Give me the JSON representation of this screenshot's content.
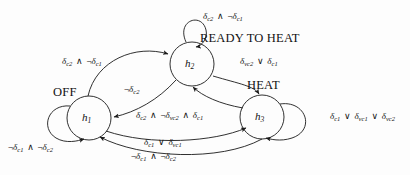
{
  "diagram": {
    "type": "state-machine",
    "title": "",
    "states": [
      {
        "id": "h1",
        "name": "h",
        "subscript": "1",
        "mode_label": "OFF",
        "cx": 89,
        "cy": 118,
        "r": 22
      },
      {
        "id": "h2",
        "name": "h",
        "subscript": "2",
        "mode_label": "READY TO HEAT",
        "cx": 192,
        "cy": 64,
        "r": 22
      },
      {
        "id": "h3",
        "name": "h",
        "subscript": "3",
        "mode_label": "HEAT",
        "cx": 262,
        "cy": 117,
        "r": 22
      }
    ],
    "self_loops": [
      {
        "id": "loop-h1",
        "state": "h1",
        "guard": "¬δc1 ∧ ¬δc2",
        "terms": [
          {
            "neg": true,
            "sym": "δ",
            "sub": "c1"
          },
          {
            "op": "∧"
          },
          {
            "neg": true,
            "sym": "δ",
            "sub": "c2"
          }
        ]
      },
      {
        "id": "loop-h2",
        "state": "h2",
        "guard": "δc2 ∧ ¬δc1",
        "terms": [
          {
            "neg": false,
            "sym": "δ",
            "sub": "c2"
          },
          {
            "op": "∧"
          },
          {
            "neg": true,
            "sym": "δ",
            "sub": "c1"
          }
        ]
      },
      {
        "id": "loop-h3",
        "state": "h3",
        "guard": "δc1 ∨ δvc1 ∨ δvc2",
        "terms": [
          {
            "neg": false,
            "sym": "δ",
            "sub": "c1"
          },
          {
            "op": "∨"
          },
          {
            "neg": false,
            "sym": "δ",
            "sub": "vc1"
          },
          {
            "op": "∨"
          },
          {
            "neg": false,
            "sym": "δ",
            "sub": "vc2"
          }
        ]
      }
    ],
    "transitions": [
      {
        "id": "h1-to-h2",
        "from": "h1",
        "to": "h2",
        "guard": "δc2 ∧ ¬δc1",
        "terms": [
          {
            "neg": false,
            "sym": "δ",
            "sub": "c2"
          },
          {
            "op": "∧"
          },
          {
            "neg": true,
            "sym": "δ",
            "sub": "c1"
          }
        ]
      },
      {
        "id": "h2-to-h1",
        "from": "h2",
        "to": "h1",
        "guard": "¬δc2",
        "terms": [
          {
            "neg": true,
            "sym": "δ",
            "sub": "c2"
          }
        ]
      },
      {
        "id": "h2-to-h3",
        "from": "h2",
        "to": "h3",
        "guard": "δvc2 ∨ δc1",
        "terms": [
          {
            "neg": false,
            "sym": "δ",
            "sub": "vc2"
          },
          {
            "op": "∨"
          },
          {
            "neg": false,
            "sym": "δ",
            "sub": "c1"
          }
        ]
      },
      {
        "id": "h3-to-h2",
        "from": "h3",
        "to": "h2",
        "guard": "δc2 ∧ ¬δvc2 ∧ δc1",
        "terms": [
          {
            "neg": false,
            "sym": "δ",
            "sub": "c2"
          },
          {
            "op": "∧"
          },
          {
            "neg": true,
            "sym": "δ",
            "sub": "vc2"
          },
          {
            "op": "∧"
          },
          {
            "neg": false,
            "sym": "δ",
            "sub": "c1"
          }
        ]
      },
      {
        "id": "h1-to-h3",
        "from": "h1",
        "to": "h3",
        "guard": "δc1 ∨ δvc1",
        "terms": [
          {
            "neg": false,
            "sym": "δ",
            "sub": "c1"
          },
          {
            "op": "∨"
          },
          {
            "neg": false,
            "sym": "δ",
            "sub": "vc1"
          }
        ]
      },
      {
        "id": "h3-to-h1",
        "from": "h3",
        "to": "h1",
        "guard": "¬δc1 ∧ ¬δc2",
        "terms": [
          {
            "neg": true,
            "sym": "δ",
            "sub": "c1"
          },
          {
            "op": "∧"
          },
          {
            "neg": true,
            "sym": "δ",
            "sub": "c2"
          }
        ]
      }
    ],
    "colors": {
      "background": "#fdfdfd",
      "stroke": "#1a1a1a",
      "text": "#111111"
    }
  }
}
